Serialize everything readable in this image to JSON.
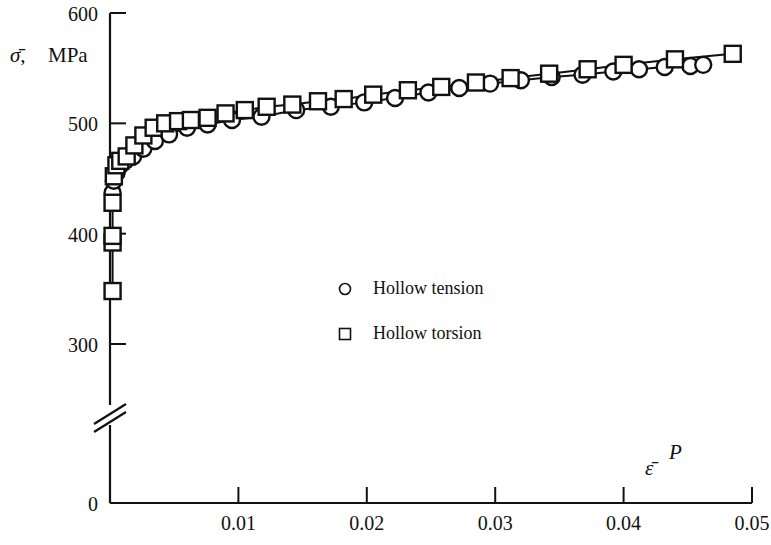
{
  "chart_data": {
    "type": "scatter",
    "title": "",
    "subtitle": "",
    "xlabel": "ε̄ᴾ",
    "xlabel_base": "ε̄",
    "xlabel_sup": "P",
    "ylabel": "σ̄,  MPa",
    "ylabel_base": "σ̄,",
    "ylabel_unit": "MPa",
    "xlim": [
      0,
      0.05
    ],
    "ylim": [
      280,
      610
    ],
    "y_axis_break": true,
    "y_axis_break_note": "axis broken between 0 and ~280 MPa",
    "grid": false,
    "legend_position": "center",
    "x_ticks": [
      0.01,
      0.02,
      0.03,
      0.04,
      0.05
    ],
    "x_tick_labels": [
      "0.01",
      "0.02",
      "0.03",
      "0.04",
      "0.05"
    ],
    "y_ticks": [
      300,
      400,
      500,
      600
    ],
    "y_tick_labels": [
      "300",
      "400",
      "500",
      "600"
    ],
    "y_origin_label": "0",
    "series": [
      {
        "name": "Hollow tension",
        "marker": "circle",
        "x": [
          0.0002,
          0.0003,
          0.0005,
          0.0008,
          0.0012,
          0.0018,
          0.0026,
          0.0035,
          0.0046,
          0.006,
          0.0076,
          0.0095,
          0.0118,
          0.0145,
          0.0172,
          0.0198,
          0.0222,
          0.0248,
          0.0272,
          0.0296,
          0.032,
          0.0344,
          0.0368,
          0.0392,
          0.0412,
          0.0432,
          0.0452,
          0.0462
        ],
        "y": [
          437,
          448,
          455,
          462,
          466,
          470,
          477,
          484,
          490,
          496,
          499,
          503,
          506,
          512,
          515,
          519,
          523,
          528,
          532,
          536,
          539,
          542,
          544,
          547,
          549,
          551,
          552,
          553
        ]
      },
      {
        "name": "Hollow torsion",
        "marker": "square",
        "x": [
          0.0002,
          0.0002,
          0.0002,
          0.0002,
          0.0003,
          0.0005,
          0.0008,
          0.0013,
          0.0019,
          0.0026,
          0.0034,
          0.0043,
          0.0053,
          0.0063,
          0.0076,
          0.009,
          0.0105,
          0.0122,
          0.0142,
          0.0162,
          0.0182,
          0.0205,
          0.0232,
          0.0258,
          0.0285,
          0.0312,
          0.0342,
          0.0372,
          0.04,
          0.044,
          0.0485
        ],
        "y": [
          348,
          392,
          398,
          428,
          452,
          462,
          466,
          470,
          480,
          489,
          496,
          500,
          502,
          503,
          505,
          509,
          512,
          515,
          517,
          520,
          522,
          526,
          530,
          533,
          537,
          541,
          545,
          549,
          553,
          558,
          563
        ]
      }
    ],
    "legend": [
      {
        "marker": "circle",
        "label": "Hollow tension"
      },
      {
        "marker": "square",
        "label": "Hollow torsion"
      }
    ]
  },
  "colors": {
    "ink": "#111111",
    "background": "#ffffff",
    "marker_fill": "#ffffff"
  }
}
